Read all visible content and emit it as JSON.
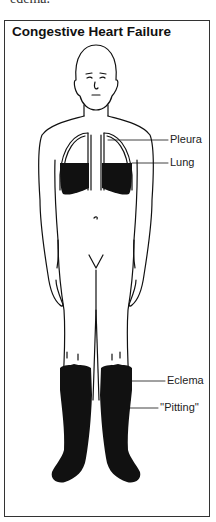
{
  "preceding_text": "edema.",
  "figure": {
    "title": "Congestive Heart Failure",
    "labels": {
      "pleura": "Pleura",
      "lung": "Lung",
      "eclema": "Eclema",
      "pitting": "''Pitting''"
    }
  },
  "colors": {
    "ink": "#111111",
    "border": "#333333",
    "background": "#ffffff"
  }
}
